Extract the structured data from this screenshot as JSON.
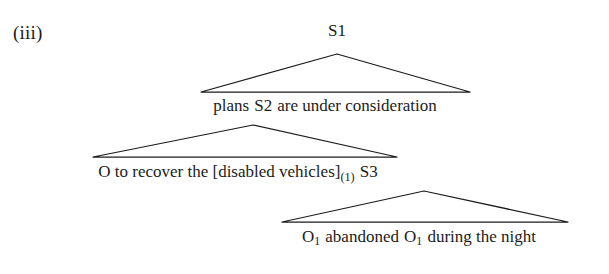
{
  "figure": {
    "example_number": "(iii)",
    "background_color": "#ffffff",
    "line_color": "#1c1c1c",
    "text_color": "#1c1c1c"
  },
  "tree": {
    "root_label": "S1",
    "tiers": [
      {
        "id": "tier-1",
        "node_label": "S1",
        "text": "S1"
      },
      {
        "id": "tier-2",
        "text": "plans S2 are under consideration",
        "before_tag": "plans",
        "node_tag": "S2",
        "after_tag": "are under consideration"
      },
      {
        "id": "tier-3",
        "text": "O to recover the [disabled vehicles](1) S3",
        "lead": "O to recover the [disabled vehicles]",
        "subscript": "(1)",
        "node_tag": "S3"
      },
      {
        "id": "tier-4",
        "text": "O1 abandoned O1 during the night",
        "first_object": "O",
        "first_object_sub": "1",
        "verb": "abandoned",
        "second_object": "O",
        "second_object_sub": "1",
        "tail": "during the night"
      }
    ],
    "triangles": [
      {
        "name": "triangle-s1",
        "apex_x": 337,
        "apex_y": 54,
        "left_x": 201,
        "right_x": 470,
        "base_y": 92
      },
      {
        "name": "triangle-s2",
        "apex_x": 253,
        "apex_y": 125,
        "left_x": 93,
        "right_x": 397,
        "base_y": 157
      },
      {
        "name": "triangle-s3",
        "apex_x": 424,
        "apex_y": 191,
        "left_x": 282,
        "right_x": 568,
        "base_y": 222
      }
    ]
  }
}
